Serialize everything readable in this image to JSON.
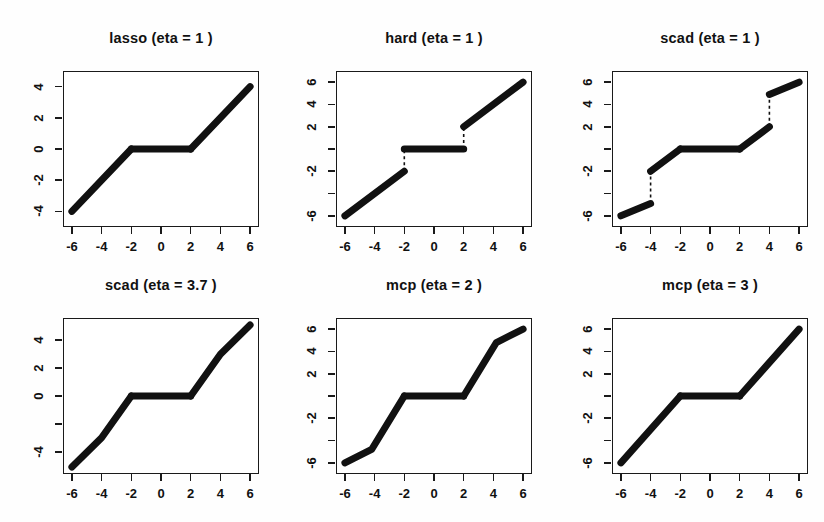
{
  "figure": {
    "background": "#ffffff",
    "line_color": "#111111",
    "axis_color": "#1a1a1a",
    "rows": 2,
    "cols": 3
  },
  "chart_data": [
    {
      "type": "line",
      "title": "lasso (eta = 1 )",
      "xlabel": "",
      "ylabel": "",
      "xlim": [
        -6.6,
        6.6
      ],
      "ylim": [
        -5.0,
        5.0
      ],
      "xticks": [
        -6,
        -4,
        -2,
        0,
        2,
        4,
        6
      ],
      "xticklabels": [
        "-6",
        "-4",
        "-2",
        "0",
        "2",
        "4",
        "6"
      ],
      "yticks": [
        -4,
        -2,
        0,
        2,
        4
      ],
      "yticklabels": [
        "-4",
        "-2",
        "0",
        "2",
        "4"
      ],
      "grid": false,
      "legend": "none",
      "segments": [
        {
          "points": [
            [
              -6,
              -4
            ],
            [
              -2,
              0
            ]
          ]
        },
        {
          "points": [
            [
              -2,
              0
            ],
            [
              2,
              0
            ]
          ]
        },
        {
          "points": [
            [
              2,
              0
            ],
            [
              6,
              4
            ]
          ]
        }
      ],
      "jumps": []
    },
    {
      "type": "line",
      "title": "hard (eta = 1 )",
      "xlabel": "",
      "ylabel": "",
      "xlim": [
        -6.6,
        6.6
      ],
      "ylim": [
        -7.0,
        7.0
      ],
      "xticks": [
        -6,
        -4,
        -2,
        0,
        2,
        4,
        6
      ],
      "xticklabels": [
        "-6",
        "-4",
        "-2",
        "0",
        "2",
        "4",
        "6"
      ],
      "yticks": [
        -6,
        -4,
        -2,
        0,
        2,
        4,
        6
      ],
      "yticklabels": [
        "-6",
        "",
        "-2",
        "",
        "2",
        "4",
        "6"
      ],
      "grid": false,
      "legend": "none",
      "segments": [
        {
          "points": [
            [
              -6,
              -6
            ],
            [
              -2,
              -2
            ]
          ]
        },
        {
          "points": [
            [
              -2,
              0
            ],
            [
              2,
              0
            ]
          ]
        },
        {
          "points": [
            [
              2,
              2
            ],
            [
              6,
              6
            ]
          ]
        }
      ],
      "jumps": [
        {
          "x": -2,
          "y0": -2,
          "y1": 0
        },
        {
          "x": 2,
          "y0": 0,
          "y1": 2
        }
      ]
    },
    {
      "type": "line",
      "title": "scad (eta = 1 )",
      "xlabel": "",
      "ylabel": "",
      "xlim": [
        -6.6,
        6.6
      ],
      "ylim": [
        -7.0,
        7.0
      ],
      "xticks": [
        -6,
        -4,
        -2,
        0,
        2,
        4,
        6
      ],
      "xticklabels": [
        "-6",
        "-4",
        "-2",
        "0",
        "2",
        "4",
        "6"
      ],
      "yticks": [
        -6,
        -4,
        -2,
        0,
        2,
        4,
        6
      ],
      "yticklabels": [
        "-6",
        "",
        "-2",
        "",
        "2",
        "4",
        "6"
      ],
      "grid": false,
      "legend": "none",
      "segments": [
        {
          "points": [
            [
              -6,
              -6
            ],
            [
              -4,
              -4.9
            ]
          ]
        },
        {
          "points": [
            [
              -4,
              -2.0
            ],
            [
              -2,
              0
            ]
          ]
        },
        {
          "points": [
            [
              -2,
              0
            ],
            [
              2,
              0
            ]
          ]
        },
        {
          "points": [
            [
              2,
              0
            ],
            [
              4,
              2.0
            ]
          ]
        },
        {
          "points": [
            [
              4,
              4.9
            ],
            [
              6,
              6
            ]
          ]
        }
      ],
      "jumps": [
        {
          "x": -4,
          "y0": -4.9,
          "y1": -2.0
        },
        {
          "x": 4,
          "y0": 2.0,
          "y1": 4.9
        }
      ]
    },
    {
      "type": "line",
      "title": "scad (eta = 3.7 )",
      "xlabel": "",
      "ylabel": "",
      "xlim": [
        -6.6,
        6.6
      ],
      "ylim": [
        -5.6,
        5.6
      ],
      "xticks": [
        -6,
        -4,
        -2,
        0,
        2,
        4,
        6
      ],
      "xticklabels": [
        "-6",
        "-4",
        "-2",
        "0",
        "2",
        "4",
        "6"
      ],
      "yticks": [
        -4,
        -2,
        0,
        2,
        4
      ],
      "yticklabels": [
        "-4",
        "",
        "0",
        "2",
        "4"
      ],
      "grid": false,
      "legend": "none",
      "segments": [
        {
          "points": [
            [
              -6,
              -5.1
            ],
            [
              -4,
              -3.0
            ],
            [
              -2,
              0
            ]
          ]
        },
        {
          "points": [
            [
              -2,
              0
            ],
            [
              2,
              0
            ]
          ]
        },
        {
          "points": [
            [
              2,
              0
            ],
            [
              4,
              3.0
            ],
            [
              6,
              5.1
            ]
          ]
        }
      ],
      "jumps": []
    },
    {
      "type": "line",
      "title": "mcp (eta = 2 )",
      "xlabel": "",
      "ylabel": "",
      "xlim": [
        -6.6,
        6.6
      ],
      "ylim": [
        -7.0,
        7.0
      ],
      "xticks": [
        -6,
        -4,
        -2,
        0,
        2,
        4,
        6
      ],
      "xticklabels": [
        "-6",
        "-4",
        "-2",
        "0",
        "2",
        "4",
        "6"
      ],
      "yticks": [
        -6,
        -4,
        -2,
        0,
        2,
        4,
        6
      ],
      "yticklabels": [
        "-6",
        "",
        "-2",
        "",
        "2",
        "4",
        "6"
      ],
      "grid": false,
      "legend": "none",
      "segments": [
        {
          "points": [
            [
              -6,
              -6
            ],
            [
              -4.2,
              -4.8
            ],
            [
              -2,
              0
            ]
          ]
        },
        {
          "points": [
            [
              -2,
              0
            ],
            [
              2,
              0
            ]
          ]
        },
        {
          "points": [
            [
              2,
              0
            ],
            [
              4.2,
              4.8
            ],
            [
              6,
              6
            ]
          ]
        }
      ],
      "jumps": []
    },
    {
      "type": "line",
      "title": "mcp (eta = 3 )",
      "xlabel": "",
      "ylabel": "",
      "xlim": [
        -6.6,
        6.6
      ],
      "ylim": [
        -7.0,
        7.0
      ],
      "xticks": [
        -6,
        -4,
        -2,
        0,
        2,
        4,
        6
      ],
      "xticklabels": [
        "-6",
        "-4",
        "-2",
        "0",
        "2",
        "4",
        "6"
      ],
      "yticks": [
        -6,
        -4,
        -2,
        0,
        2,
        4,
        6
      ],
      "yticklabels": [
        "-6",
        "",
        "-2",
        "",
        "2",
        "4",
        "6"
      ],
      "grid": false,
      "legend": "none",
      "segments": [
        {
          "points": [
            [
              -6,
              -6
            ],
            [
              -2,
              0
            ]
          ]
        },
        {
          "points": [
            [
              -2,
              0
            ],
            [
              2,
              0
            ]
          ]
        },
        {
          "points": [
            [
              2,
              0
            ],
            [
              6,
              6
            ]
          ]
        }
      ],
      "jumps": []
    }
  ],
  "panel_geometry": [
    {
      "left": 63,
      "top": 71,
      "width": 196,
      "height": 156,
      "title_top": 30
    },
    {
      "left": 336,
      "top": 71,
      "width": 196,
      "height": 156,
      "title_top": 30
    },
    {
      "left": 612,
      "top": 71,
      "width": 196,
      "height": 156,
      "title_top": 30
    },
    {
      "left": 63,
      "top": 318,
      "width": 196,
      "height": 156,
      "title_top": 277
    },
    {
      "left": 336,
      "top": 318,
      "width": 196,
      "height": 156,
      "title_top": 277
    },
    {
      "left": 612,
      "top": 318,
      "width": 196,
      "height": 156,
      "title_top": 277
    }
  ]
}
